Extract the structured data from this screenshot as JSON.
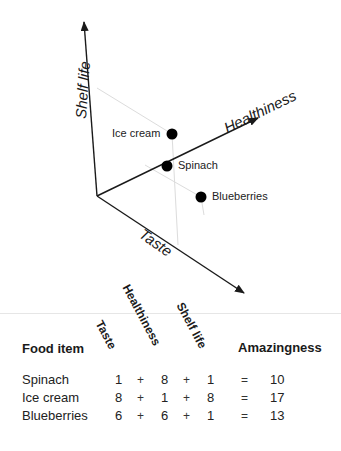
{
  "diagram": {
    "axes": {
      "shelf_life": "Shelf life",
      "healthiness": "Healthiness",
      "taste": "Taste"
    },
    "points": [
      {
        "label": "Ice cream",
        "taste": 8,
        "healthiness": 1,
        "shelf_life": 8
      },
      {
        "label": "Spinach",
        "taste": 1,
        "healthiness": 8,
        "shelf_life": 1
      },
      {
        "label": "Blueberries",
        "taste": 6,
        "healthiness": 6,
        "shelf_life": 1
      }
    ]
  },
  "table": {
    "headers": {
      "food_item": "Food item",
      "taste": "Taste",
      "healthiness": "Healthiness",
      "shelf_life": "Shelf life",
      "amazingness": "Amazingness"
    },
    "operators": {
      "plus": "+",
      "equals": "="
    },
    "rows": [
      {
        "item": "Spinach",
        "taste": "1",
        "healthiness": "8",
        "shelf_life": "1",
        "amazingness": "10"
      },
      {
        "item": "Ice cream",
        "taste": "8",
        "healthiness": "1",
        "shelf_life": "8",
        "amazingness": "17"
      },
      {
        "item": "Blueberries",
        "taste": "6",
        "healthiness": "6",
        "shelf_life": "1",
        "amazingness": "13"
      }
    ]
  },
  "colors": {
    "axis": "#1a1a1a",
    "guide": "#d9d9d9",
    "point": "#000000"
  }
}
